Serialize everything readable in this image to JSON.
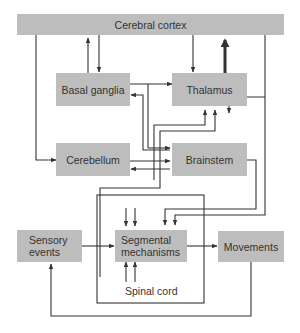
{
  "diagram": {
    "nodes": {
      "cortex": {
        "label": "Cerebral cortex"
      },
      "basal_ganglia": {
        "label": "Basal ganglia"
      },
      "thalamus": {
        "label": "Thalamus"
      },
      "cerebellum": {
        "label": "Cerebellum"
      },
      "brainstem": {
        "label": "Brainstem"
      },
      "sensory": {
        "label_line1": "Sensory",
        "label_line2": "events"
      },
      "segmental": {
        "label_line1": "Segmental",
        "label_line2": "mechanisms"
      },
      "movements": {
        "label": "Movements"
      },
      "spinal_cord": {
        "label": "Spinal cord"
      }
    },
    "edges": [
      {
        "from": "basal_ganglia",
        "to": "cortex"
      },
      {
        "from": "cortex",
        "to": "basal_ganglia"
      },
      {
        "from": "cortex",
        "to": "thalamus"
      },
      {
        "from": "thalamus",
        "to": "cortex",
        "weight": "heavy"
      },
      {
        "from": "cortex",
        "to": "cerebellum"
      },
      {
        "from": "cortex",
        "to": "brainstem"
      },
      {
        "from": "basal_ganglia",
        "to": "thalamus"
      },
      {
        "from": "basal_ganglia",
        "to": "brainstem"
      },
      {
        "from": "brainstem",
        "to": "basal_ganglia"
      },
      {
        "from": "cerebellum",
        "to": "brainstem"
      },
      {
        "from": "brainstem",
        "to": "cerebellum"
      },
      {
        "from": "cerebellum",
        "to": "thalamus"
      },
      {
        "from": "brainstem",
        "to": "thalamus"
      },
      {
        "from": "cortex",
        "to": "segmental"
      },
      {
        "from": "brainstem",
        "to": "segmental"
      },
      {
        "from": "sensory",
        "to": "segmental"
      },
      {
        "from": "segmental",
        "to": "movements"
      },
      {
        "from": "movements",
        "to": "sensory"
      }
    ],
    "colors": {
      "box": "#bdbdbd",
      "line": "#333333",
      "text": "#333333"
    }
  }
}
